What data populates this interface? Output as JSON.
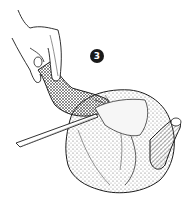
{
  "illustration": {
    "subject": "hand holding chicken leg while knife cuts at joint",
    "step_number": "3",
    "colors": {
      "ink": "#1a1a1a",
      "background": "#ffffff",
      "shading": "#8a8a8a"
    }
  }
}
